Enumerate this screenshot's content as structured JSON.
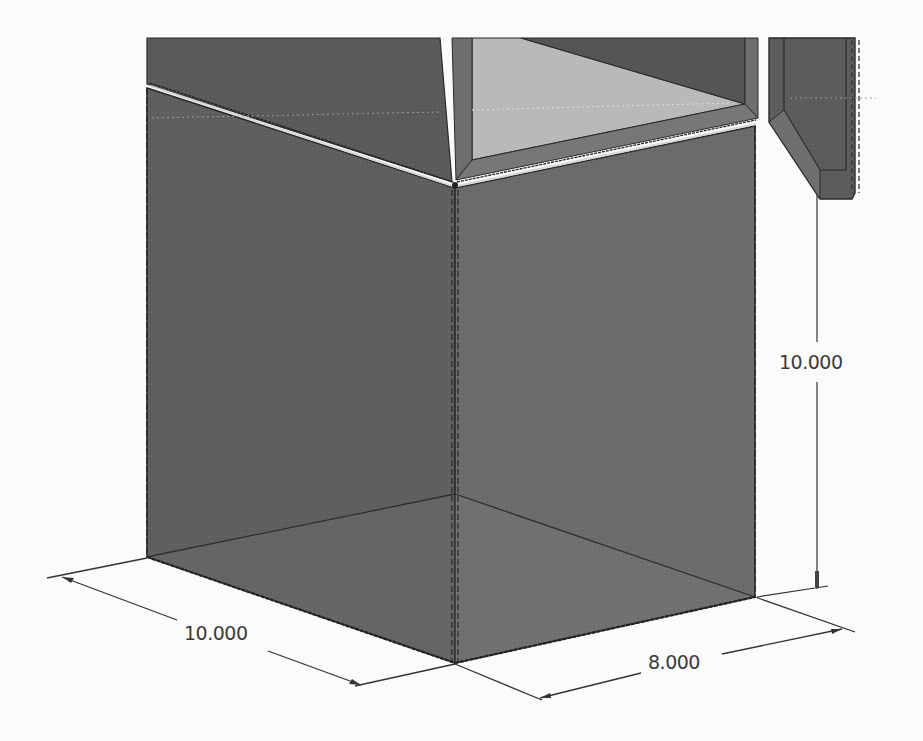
{
  "drawing": {
    "view": "isometric",
    "model": "box with lid and hinged door panel",
    "colors": {
      "background": "#fbfbfb",
      "face_dark": "#5e5e5e",
      "face_mid": "#6a6a6a",
      "face_light": "#747474",
      "inner_floor": "#b8b8b8",
      "edge": "#2a2a2a",
      "dimension_line": "#333333",
      "highlight": "#d8d8d8"
    }
  },
  "dimensions": {
    "height": {
      "label": "10.000",
      "value": 10.0,
      "orientation": "vertical"
    },
    "width": {
      "label": "10.000",
      "value": 10.0,
      "orientation": "left-isometric"
    },
    "depth": {
      "label": "8.000",
      "value": 8.0,
      "orientation": "right-isometric"
    }
  }
}
